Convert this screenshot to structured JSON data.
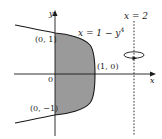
{
  "diagram": {
    "type": "region-of-revolution",
    "axes": {
      "x_label": "x",
      "y_label": "y",
      "origin_label": "0"
    },
    "curve": {
      "equation": "x = 1 − y⁴",
      "label_text": "x = 1 − y",
      "label_exponent": "4"
    },
    "axis_of_rotation": {
      "label": "x = 2",
      "style": "dashed",
      "rotation_symbol": "circular-arrow-icon"
    },
    "points": [
      {
        "label": "(0, 1)"
      },
      {
        "label": "(1, 0)"
      },
      {
        "label": "(0, −1)"
      }
    ],
    "shaded_region": {
      "description": "region bounded by x = 1 − y⁴ and the y-axis",
      "fill": "#9a9a9a"
    },
    "colors": {
      "line": "#1a1a1a",
      "shade": "#9a9a9a",
      "text": "#222222"
    }
  }
}
